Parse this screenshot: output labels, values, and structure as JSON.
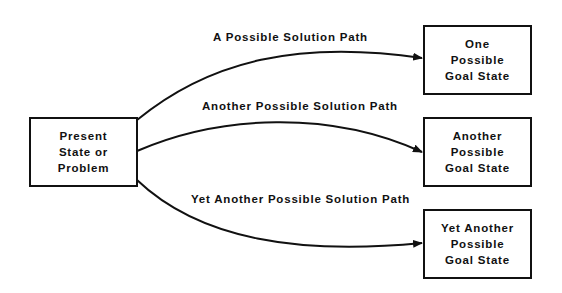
{
  "diagram": {
    "source": {
      "lines": [
        "Present",
        "State or",
        "Problem"
      ]
    },
    "goals": [
      {
        "lines": [
          "One",
          "Possible",
          "Goal State"
        ]
      },
      {
        "lines": [
          "Another",
          "Possible",
          "Goal State"
        ]
      },
      {
        "lines": [
          "Yet Another",
          "Possible",
          "Goal State"
        ]
      }
    ],
    "paths": [
      {
        "label": "A Possible Solution Path"
      },
      {
        "label": "Another Possible Solution Path"
      },
      {
        "label": "Yet Another Possible Solution Path"
      }
    ],
    "colors": {
      "stroke": "#111111",
      "background": "#ffffff"
    }
  }
}
